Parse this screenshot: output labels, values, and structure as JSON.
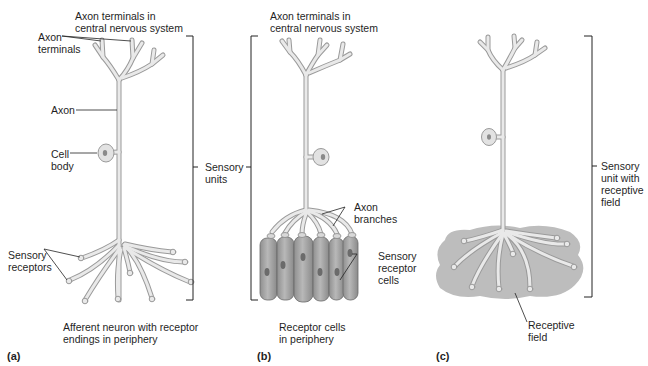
{
  "figure": {
    "panels": [
      {
        "id": "a",
        "letter": "(a)",
        "caption_line1": "Afferent neuron with receptor",
        "caption_line2": "endings in periphery",
        "labels": {
          "cns_terminals_line1": "Axon terminals in",
          "cns_terminals_line2": "central nervous system",
          "axon_terminals_line1": "Axon",
          "axon_terminals_line2": "terminals",
          "axon": "Axon",
          "cell_body_line1": "Cell",
          "cell_body_line2": "body",
          "sensory_receptors_line1": "Sensory",
          "sensory_receptors_line2": "receptors"
        }
      },
      {
        "id": "b",
        "letter": "(b)",
        "caption_line1": "Receptor cells",
        "caption_line2": "in periphery",
        "labels": {
          "cns_terminals_line1": "Axon terminals in",
          "cns_terminals_line2": "central nervous system",
          "axon_branches_line1": "Axon",
          "axon_branches_line2": "branches",
          "receptor_cells_line1": "Sensory",
          "receptor_cells_line2": "receptor",
          "receptor_cells_line3": "cells"
        }
      },
      {
        "id": "c",
        "letter": "(c)",
        "labels": {
          "sensory_unit_line1": "Sensory",
          "sensory_unit_line2": "unit with",
          "sensory_unit_line3": "receptive",
          "sensory_unit_line4": "field",
          "receptive_field_line1": "Receptive",
          "receptive_field_line2": "field"
        }
      }
    ],
    "shared_labels": {
      "sensory_units_line1": "Sensory",
      "sensory_units_line2": "units"
    },
    "colors": {
      "neuron_fill": "#e8e8e8",
      "neuron_stroke": "#9a9a9a",
      "receptor_cell_fill": "#a9a9a9",
      "nucleus_fill": "#6e6e6e",
      "receptive_field_fill": "#bdbdbd",
      "text": "#1f1f1f"
    }
  }
}
